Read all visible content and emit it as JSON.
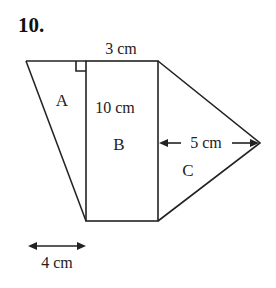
{
  "question_number": "10.",
  "figure": {
    "regions": {
      "A": "A",
      "B": "B",
      "C": "C"
    },
    "dimensions": {
      "top_width": "3 cm",
      "height": "10 cm",
      "triangle_c_height": "5 cm",
      "bottom_offset": "4 cm"
    },
    "right_angle_marker": true
  },
  "colors": {
    "line": "#222222",
    "background": "#ffffff"
  }
}
